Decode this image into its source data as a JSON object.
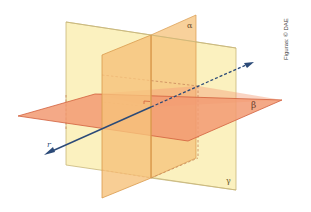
{
  "diagram": {
    "labels": {
      "alpha": "α",
      "beta": "β",
      "gamma": "γ",
      "line": "r"
    },
    "credit": "Figuras: © DAE",
    "colors": {
      "gamma_plane": "#fbefb8",
      "gamma_edge": "#c8b67a",
      "alpha_plane": "#f6c27a",
      "alpha_edge": "#d99a4c",
      "beta_plane": "#f4a07a",
      "beta_edge": "#d2603c",
      "line_r": "#2b4a78",
      "right_angle_mark": "#d2603c"
    }
  }
}
